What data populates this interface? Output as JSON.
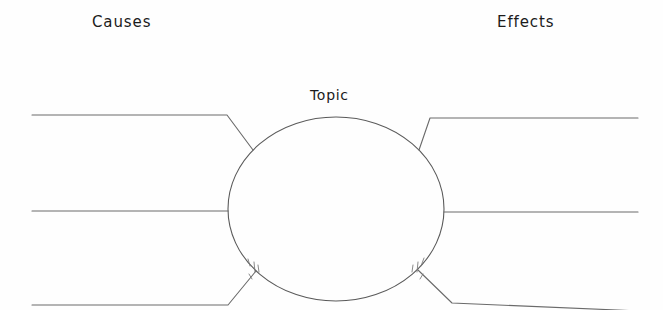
{
  "worksheet": {
    "type": "cause-and-effect-graphic-organizer",
    "title_left": "Causes",
    "title_right": "Effects",
    "center_label": "Topic",
    "background_color": "#fefefe",
    "ink_color": "#5a5a5a",
    "text_color": "#1b1b1b"
  },
  "center_node": {
    "label": "Topic",
    "shape": "ellipse",
    "center_x": 336,
    "center_y": 209,
    "radius_x": 108,
    "radius_y": 92
  },
  "cause_lines": [
    {
      "id": "cause-line-top",
      "name": "cause-write-line-1",
      "x_start": 32,
      "y_start": 115,
      "x_elbow": 227,
      "y_elbow": 115,
      "x_end": 253,
      "y_end": 150
    },
    {
      "id": "cause-line-middle",
      "name": "cause-write-line-2",
      "x_start": 32,
      "y_start": 211,
      "x_elbow": 228,
      "y_elbow": 211,
      "x_end": 228,
      "y_end": 211
    },
    {
      "id": "cause-line-bottom",
      "name": "cause-write-line-3",
      "x_start": 32,
      "y_start": 305,
      "x_elbow": 228,
      "y_elbow": 305,
      "x_end": 256,
      "y_end": 271
    }
  ],
  "effect_lines": [
    {
      "id": "effect-line-top",
      "name": "effect-write-line-1",
      "x_start": 638,
      "y_start": 118,
      "x_elbow": 430,
      "y_elbow": 118,
      "x_end": 419,
      "y_end": 150
    },
    {
      "id": "effect-line-middle",
      "name": "effect-write-line-2",
      "x_start": 638,
      "y_start": 212,
      "x_elbow": 444,
      "y_elbow": 212,
      "x_end": 444,
      "y_end": 212
    },
    {
      "id": "effect-line-bottom",
      "name": "effect-write-line-3",
      "x_start": 663,
      "y_start": 310,
      "x_elbow": 450,
      "y_elbow": 302,
      "x_end": 418,
      "y_end": 270
    }
  ]
}
